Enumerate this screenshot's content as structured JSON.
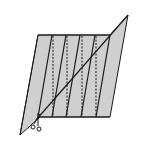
{
  "diagram": {
    "type": "paper-folding-cut",
    "colors": {
      "paper": "#cfcfcf",
      "stroke": "#1a1a1a",
      "background": "#ffffff"
    },
    "panel_count": 5,
    "fold_lines": {
      "solid": 5,
      "dashed": 4
    },
    "icons": [
      "scissors-icon"
    ]
  }
}
